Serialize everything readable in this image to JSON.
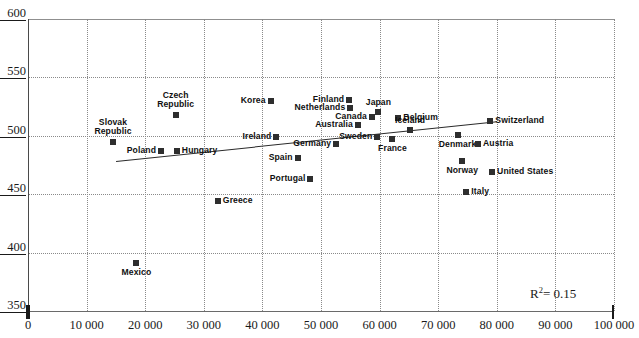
{
  "chart_data": {
    "type": "scatter",
    "title": "",
    "xlabel": "",
    "ylabel": "",
    "xlim": [
      0,
      100000
    ],
    "ylim": [
      350,
      600
    ],
    "grid": true,
    "legend": "none",
    "xticks": [
      "0",
      "10 000",
      "20 000",
      "30 000",
      "40 000",
      "50 000",
      "60 000",
      "70 000",
      "80 000",
      "90 000",
      "100 000"
    ],
    "xtick_values": [
      0,
      10000,
      20000,
      30000,
      40000,
      50000,
      60000,
      70000,
      80000,
      90000,
      100000
    ],
    "yticks": [
      "350",
      "400",
      "450",
      "500",
      "550",
      "600"
    ],
    "ytick_values": [
      350,
      400,
      450,
      500,
      550,
      600
    ],
    "annotation": "R² = 0.15",
    "r_squared": 0.15,
    "trendline": {
      "x0": 15000,
      "y0": 478,
      "x1": 80000,
      "y1": 512
    },
    "points": [
      {
        "label": "Mexico",
        "x": 18500,
        "y": 391,
        "pos": "b"
      },
      {
        "label": "Slovak Republic",
        "x": 14500,
        "y": 495,
        "pos": "t"
      },
      {
        "label": "Poland",
        "x": 22700,
        "y": 487,
        "pos": "r"
      },
      {
        "label": "Hungary",
        "x": 25400,
        "y": 487,
        "pos": "l"
      },
      {
        "label": "Czech Republic",
        "x": 25200,
        "y": 518,
        "pos": "t"
      },
      {
        "label": "Greece",
        "x": 32400,
        "y": 444,
        "pos": "l"
      },
      {
        "label": "Korea",
        "x": 41400,
        "y": 530,
        "pos": "r"
      },
      {
        "label": "Ireland",
        "x": 42400,
        "y": 499,
        "pos": "r"
      },
      {
        "label": "Spain",
        "x": 46000,
        "y": 481,
        "pos": "r"
      },
      {
        "label": "Portugal",
        "x": 48200,
        "y": 463,
        "pos": "r"
      },
      {
        "label": "Finland",
        "x": 54800,
        "y": 531,
        "pos": "r"
      },
      {
        "label": "Netherlands",
        "x": 55000,
        "y": 524,
        "pos": "r"
      },
      {
        "label": "Australia",
        "x": 56300,
        "y": 509,
        "pos": "r"
      },
      {
        "label": "Germany",
        "x": 52600,
        "y": 493,
        "pos": "r"
      },
      {
        "label": "Canada",
        "x": 58700,
        "y": 516,
        "pos": "r"
      },
      {
        "label": "Japan",
        "x": 59800,
        "y": 520,
        "pos": "t"
      },
      {
        "label": "Sweden",
        "x": 59600,
        "y": 499,
        "pos": "r"
      },
      {
        "label": "Belgium",
        "x": 63200,
        "y": 515,
        "pos": "l"
      },
      {
        "label": "Iceland",
        "x": 65200,
        "y": 505,
        "pos": "t"
      },
      {
        "label": "France",
        "x": 62200,
        "y": 497,
        "pos": "b"
      },
      {
        "label": "Denmark",
        "x": 73300,
        "y": 501,
        "pos": "b"
      },
      {
        "label": "Norway",
        "x": 74100,
        "y": 478,
        "pos": "b"
      },
      {
        "label": "Austria",
        "x": 76800,
        "y": 493,
        "pos": "l"
      },
      {
        "label": "Italy",
        "x": 74800,
        "y": 452,
        "pos": "l"
      },
      {
        "label": "Switzerland",
        "x": 78900,
        "y": 513,
        "pos": "l"
      },
      {
        "label": "United States",
        "x": 79200,
        "y": 469,
        "pos": "l"
      }
    ]
  }
}
